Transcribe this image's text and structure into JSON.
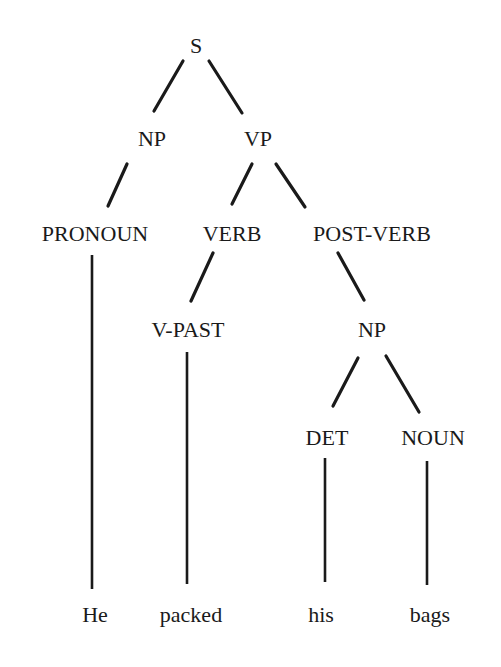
{
  "diagram": {
    "type": "parse-tree",
    "sentence": [
      "He",
      "packed",
      "his",
      "bags"
    ],
    "nodes": {
      "s": {
        "label": "S",
        "x": 196,
        "y": 53
      },
      "np1": {
        "label": "NP",
        "x": 152,
        "y": 146
      },
      "vp": {
        "label": "VP",
        "x": 258,
        "y": 146
      },
      "pronoun": {
        "label": "PRONOUN",
        "x": 95,
        "y": 241
      },
      "verb": {
        "label": "VERB",
        "x": 232,
        "y": 241
      },
      "postverb": {
        "label": "POST-VERB",
        "x": 372,
        "y": 241
      },
      "vpast": {
        "label": "V-PAST",
        "x": 188,
        "y": 337
      },
      "np2": {
        "label": "NP",
        "x": 372,
        "y": 337
      },
      "det": {
        "label": "DET",
        "x": 327,
        "y": 445
      },
      "noun": {
        "label": "NOUN",
        "x": 433,
        "y": 445
      },
      "w_he": {
        "label": "He",
        "x": 95,
        "y": 622
      },
      "w_packed": {
        "label": "packed",
        "x": 191,
        "y": 622
      },
      "w_his": {
        "label": "his",
        "x": 321,
        "y": 622
      },
      "w_bags": {
        "label": "bags",
        "x": 430,
        "y": 622
      }
    },
    "edges": [
      {
        "from": "S",
        "to": "NP",
        "x1": 183,
        "y1": 61,
        "x2": 154,
        "y2": 111
      },
      {
        "from": "S",
        "to": "VP",
        "x1": 209,
        "y1": 61,
        "x2": 242,
        "y2": 113
      },
      {
        "from": "NP",
        "to": "PRONOUN",
        "x1": 127,
        "y1": 164,
        "x2": 108,
        "y2": 206
      },
      {
        "from": "VP",
        "to": "VERB",
        "x1": 252,
        "y1": 164,
        "x2": 232,
        "y2": 204
      },
      {
        "from": "VP",
        "to": "POST-VERB",
        "x1": 276,
        "y1": 164,
        "x2": 305,
        "y2": 207
      },
      {
        "from": "VERB",
        "to": "V-PAST",
        "x1": 213,
        "y1": 253,
        "x2": 191,
        "y2": 301
      },
      {
        "from": "POST-VERB",
        "to": "NP",
        "x1": 338,
        "y1": 253,
        "x2": 364,
        "y2": 300
      },
      {
        "from": "NP",
        "to": "DET",
        "x1": 358,
        "y1": 358,
        "x2": 333,
        "y2": 406
      },
      {
        "from": "NP",
        "to": "NOUN",
        "x1": 386,
        "y1": 356,
        "x2": 419,
        "y2": 412
      }
    ],
    "stems": [
      {
        "from": "PRONOUN",
        "to": "He",
        "x": 92,
        "y1": 255,
        "y2": 589
      },
      {
        "from": "V-PAST",
        "to": "packed",
        "x": 187,
        "y1": 352,
        "y2": 584
      },
      {
        "from": "DET",
        "to": "his",
        "x": 325,
        "y1": 458,
        "y2": 582
      },
      {
        "from": "NOUN",
        "to": "bags",
        "x": 427,
        "y1": 461,
        "y2": 585
      }
    ]
  }
}
